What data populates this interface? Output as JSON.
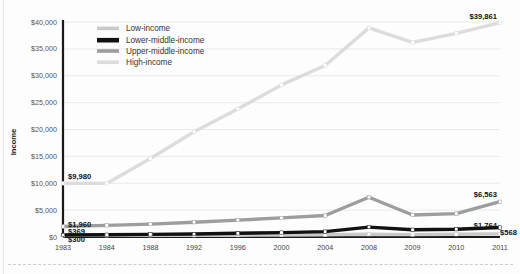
{
  "chart_data": {
    "type": "line",
    "title": "",
    "xlabel": "",
    "ylabel": "Income",
    "ylim": [
      0,
      40000
    ],
    "ytick_labels": [
      "$0",
      "$5,000",
      "$10,000",
      "$15,000",
      "$20,000",
      "$25,000",
      "$30,000",
      "$35,000",
      "$40,000"
    ],
    "ytick_values": [
      0,
      5000,
      10000,
      15000,
      20000,
      25000,
      30000,
      35000,
      40000
    ],
    "grid": true,
    "legend_position": "top-left-inside",
    "categories": [
      "1983",
      "1984",
      "1988",
      "1992",
      "1996",
      "2000",
      "2004",
      "2008",
      "2009",
      "2010",
      "2011"
    ],
    "series": [
      {
        "name": "High-income",
        "color": "#dcdcdc",
        "values": [
          9980,
          9980,
          14600,
          19600,
          23800,
          28300,
          31900,
          38900,
          36200,
          37900,
          39861
        ],
        "start_label": "$9,980",
        "end_label": "$39,861"
      },
      {
        "name": "Upper-middle-income",
        "color": "#9d9d9d",
        "values": [
          1960,
          2150,
          2400,
          2750,
          3150,
          3550,
          4000,
          7400,
          4100,
          4350,
          6563
        ],
        "start_label": "$1,960",
        "end_label": "$6,563"
      },
      {
        "name": "Lower-middle-income",
        "color": "#111111",
        "values": [
          369,
          420,
          480,
          560,
          680,
          820,
          1000,
          1850,
          1350,
          1450,
          1764
        ],
        "start_label": "$369",
        "end_label": "$1,764"
      },
      {
        "name": "Low-income",
        "color": "#c9c9c9",
        "values": [
          300,
          300,
          310,
          320,
          340,
          370,
          400,
          520,
          450,
          500,
          568
        ],
        "start_label": "$300",
        "end_label": "$568"
      }
    ],
    "legend_entries": [
      {
        "label": "Low-income",
        "color": "#c9c9c9"
      },
      {
        "label": "Lower-middle-income",
        "color": "#111111"
      },
      {
        "label": "Upper-middle-income",
        "color": "#9d9d9d"
      },
      {
        "label": "High-income",
        "color": "#dcdcdc"
      }
    ],
    "point_labels": {
      "high_start": "$9,980",
      "high_end": "$39,861",
      "uppermid_start": "$1,960",
      "uppermid_end": "$6,563",
      "lowermid_start": "$369",
      "lowermid_end": "$1,764",
      "low_start": "$300",
      "low_end": "$568"
    }
  }
}
